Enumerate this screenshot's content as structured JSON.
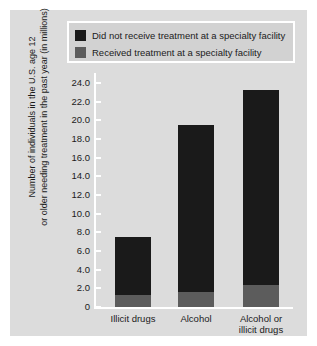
{
  "legend": {
    "items": [
      {
        "label": "Did not receive treatment at a specialty facility",
        "color": "#1a1a1a",
        "key": "did_not_receive"
      },
      {
        "label": "Received treatment at a specialty facility",
        "color": "#5c5c5c",
        "key": "received"
      }
    ]
  },
  "axis": {
    "ylabel_line1": "Number of individuals in the U.S. age 12",
    "ylabel_line2": "or older needing treatment in the past year (in millions)",
    "yticks": [
      "24.0",
      "22.0",
      "20.0",
      "18.0",
      "16.0",
      "14.0",
      "12.0",
      "10.0",
      "8.0",
      "6.0",
      "4.0",
      "2.0",
      "0"
    ]
  },
  "categories": [
    {
      "line1": "Illicit drugs",
      "line2": ""
    },
    {
      "line1": "Alcohol",
      "line2": ""
    },
    {
      "line1": "Alcohol or",
      "line2": "illicit drugs"
    }
  ],
  "chart_data": {
    "type": "bar",
    "subtype": "stacked",
    "title": "",
    "xlabel": "",
    "ylabel": "Number of individuals in the U.S. age 12 or older needing treatment in the past year (in millions)",
    "categories": [
      "Illicit drugs",
      "Alcohol",
      "Alcohol or illicit drugs"
    ],
    "series": [
      {
        "name": "Received treatment at a specialty facility",
        "color": "#5c5c5c",
        "values": [
          1.3,
          1.6,
          2.4
        ]
      },
      {
        "name": "Did not receive treatment at a specialty facility",
        "color": "#1a1a1a",
        "values": [
          6.2,
          17.9,
          20.8
        ]
      }
    ],
    "totals": [
      7.5,
      19.5,
      23.2
    ],
    "ylim": [
      0,
      24.0
    ],
    "ytick_step": 2.0,
    "grid": false,
    "legend_position": "top"
  }
}
